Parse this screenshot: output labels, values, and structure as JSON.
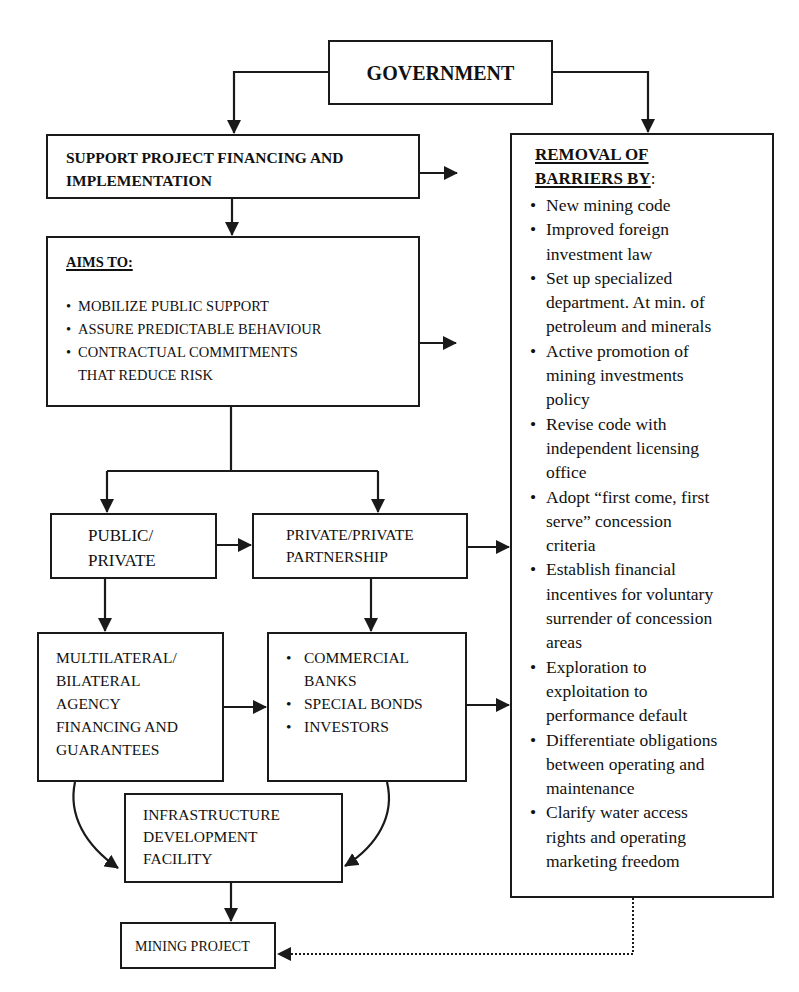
{
  "diagram": {
    "government": {
      "label": "GOVERNMENT"
    },
    "support": {
      "label": "SUPPORT PROJECT FINANCING AND\nIMPLEMENTATION"
    },
    "aims": {
      "heading": "AIMS TO:",
      "items": [
        "MOBILIZE PUBLIC SUPPORT",
        "ASSURE PREDICTABLE BEHAVIOUR",
        "CONTRACTUAL COMMITMENTS\nTHAT REDUCE RISK"
      ]
    },
    "public_private": {
      "label": "PUBLIC/\nPRIVATE"
    },
    "private_private": {
      "label": "PRIVATE/PRIVATE\nPARTNERSHIP"
    },
    "multilateral": {
      "label": "MULTILATERAL/\nBILATERAL\nAGENCY\nFINANCING AND\nGUARANTEES"
    },
    "funding_sources": {
      "items": [
        "COMMERCIAL\nBANKS",
        "SPECIAL BONDS",
        "INVESTORS"
      ]
    },
    "infrastructure": {
      "label": "INFRASTRUCTURE\nDEVELOPMENT\nFACILITY"
    },
    "mining_project": {
      "label": "MINING PROJECT"
    },
    "barriers": {
      "heading_line1": "REMOVAL OF",
      "heading_line2": "BARRIERS BY",
      "heading_suffix": ":",
      "items": [
        "New mining code",
        "Improved foreign\ninvestment law",
        "Set up specialized\ndepartment. At min. of\npetroleum and minerals",
        "Active promotion of\nmining investments\npolicy",
        "Revise code with\nindependent licensing\noffice",
        "Adopt “first come, first\nserve” concession\ncriteria",
        "Establish financial\nincentives for voluntary\nsurrender of concession\nareas",
        "Exploration to\nexploitation to\nperformance default",
        "Differentiate obligations\nbetween operating and\nmaintenance",
        "Clarify water access\nrights and operating\nmarketing freedom"
      ]
    },
    "bullet_glyph": "•",
    "colors": {
      "line": "#1a1a1a",
      "background": "#ffffff"
    }
  }
}
